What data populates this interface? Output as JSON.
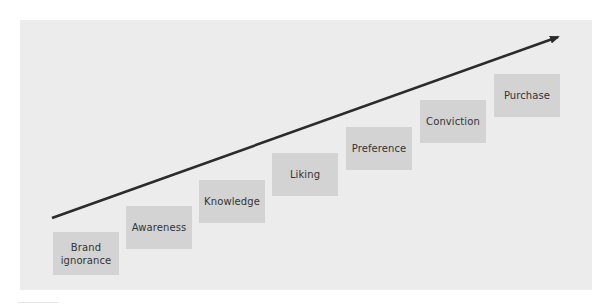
{
  "diagram": {
    "type": "staircase-progression",
    "colors": {
      "background": "#ececec",
      "step_fill": "#d3d3d3",
      "text": "#333333",
      "arrow": "#2b2b2b"
    },
    "arrow": {
      "icon": "arrow-up-right-icon",
      "start": [
        52,
        218
      ],
      "end": [
        561,
        36
      ]
    },
    "steps": [
      {
        "label": "Brand ignorance",
        "line1": "Brand",
        "line2": "ignorance",
        "x": 53,
        "y": 232
      },
      {
        "label": "Awareness",
        "x": 126,
        "y": 206
      },
      {
        "label": "Knowledge",
        "x": 199,
        "y": 180
      },
      {
        "label": "Liking",
        "x": 272,
        "y": 153
      },
      {
        "label": "Preference",
        "x": 346,
        "y": 127
      },
      {
        "label": "Conviction",
        "x": 420,
        "y": 100
      },
      {
        "label": "Purchase",
        "x": 494,
        "y": 74
      }
    ]
  }
}
